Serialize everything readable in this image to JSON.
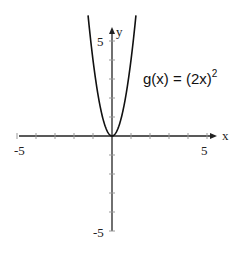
{
  "chart_data": {
    "type": "line",
    "title": "",
    "function_label": "g(x) = (2x)",
    "function_exponent": "2",
    "expression": "g(x) = (2x)^2",
    "xlabel": "x",
    "ylabel": "y",
    "xlim": [
      -5,
      5
    ],
    "ylim": [
      -5,
      5
    ],
    "x_tick_labels": [
      "-5",
      "5"
    ],
    "y_tick_labels": [
      "5",
      "-5"
    ],
    "tick_interval": 1,
    "grid": false,
    "series": [
      {
        "name": "g(x) = (2x)^2",
        "x": [
          -1.25,
          -1,
          -0.75,
          -0.5,
          -0.25,
          0,
          0.25,
          0.5,
          0.75,
          1,
          1.25
        ],
        "y": [
          6.25,
          4,
          2.25,
          1,
          0.25,
          0,
          0.25,
          1,
          2.25,
          4,
          6.25
        ]
      }
    ]
  }
}
